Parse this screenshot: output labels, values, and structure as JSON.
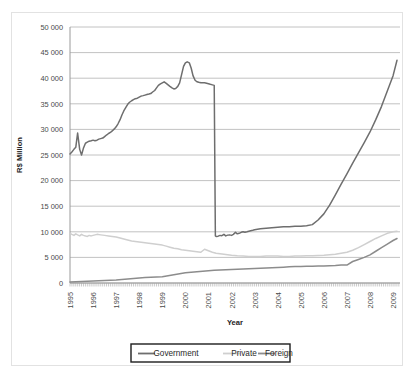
{
  "chart_data": {
    "type": "line",
    "title": "",
    "xlabel": "Year",
    "ylabel": "R$ Million",
    "xlim": [
      1995.0,
      2009.3
    ],
    "ylim": [
      0,
      50000
    ],
    "grid": true,
    "legend_position": "bottom",
    "ytick_labels": [
      "0",
      "5 000",
      "10 000",
      "15 000",
      "20 000",
      "25 000",
      "30 000",
      "35 000",
      "40 000",
      "45 000",
      "50 000"
    ],
    "ytick_values": [
      0,
      5000,
      10000,
      15000,
      20000,
      25000,
      30000,
      35000,
      40000,
      45000,
      50000
    ],
    "xtick_labels": [
      "1995",
      "1996",
      "1997",
      "1998",
      "1999",
      "2000",
      "2001",
      "2002",
      "2003",
      "2004",
      "2005",
      "2006",
      "2007",
      "2008",
      "2009"
    ],
    "xtick_values": [
      1995,
      1996,
      1997,
      1998,
      1999,
      2000,
      2001,
      2002,
      2003,
      2004,
      2005,
      2006,
      2007,
      2008,
      2009
    ],
    "series": [
      {
        "name": "Government",
        "color": "#6e6e6e",
        "x": [
          1995.0,
          1995.08,
          1995.17,
          1995.25,
          1995.33,
          1995.42,
          1995.5,
          1995.58,
          1995.67,
          1995.75,
          1995.83,
          1995.92,
          1996.0,
          1996.08,
          1996.17,
          1996.25,
          1996.33,
          1996.42,
          1996.5,
          1996.58,
          1996.67,
          1996.75,
          1996.83,
          1996.92,
          1997.0,
          1997.08,
          1997.17,
          1997.25,
          1997.33,
          1997.42,
          1997.5,
          1997.58,
          1997.67,
          1997.75,
          1997.83,
          1997.92,
          1998.0,
          1998.08,
          1998.17,
          1998.25,
          1998.33,
          1998.42,
          1998.5,
          1998.58,
          1998.67,
          1998.75,
          1998.83,
          1998.92,
          1999.0,
          1999.08,
          1999.17,
          1999.25,
          1999.33,
          1999.42,
          1999.5,
          1999.58,
          1999.67,
          1999.75,
          1999.83,
          1999.92,
          2000.0,
          2000.08,
          2000.17,
          2000.25,
          2000.33,
          2000.42,
          2000.5,
          2000.58,
          2000.67,
          2000.75,
          2000.83,
          2000.92,
          2001.0,
          2001.08,
          2001.17,
          2001.25,
          2001.3,
          2001.33,
          2001.42,
          2001.5,
          2001.58,
          2001.67,
          2001.75,
          2001.83,
          2001.92,
          2002.0,
          2002.08,
          2002.17,
          2002.25,
          2002.33,
          2002.42,
          2002.5,
          2002.58,
          2002.67,
          2002.75,
          2002.83,
          2002.92,
          2003.0,
          2003.25,
          2003.5,
          2003.75,
          2004.0,
          2004.25,
          2004.5,
          2004.75,
          2005.0,
          2005.25,
          2005.5,
          2005.75,
          2006.0,
          2006.25,
          2006.5,
          2006.75,
          2007.0,
          2007.25,
          2007.5,
          2007.75,
          2008.0,
          2008.25,
          2008.5,
          2008.75,
          2009.0,
          2009.17
        ],
        "values": [
          25200,
          25600,
          26100,
          26500,
          29300,
          26100,
          25000,
          26300,
          27300,
          27500,
          27700,
          27800,
          27900,
          27800,
          27900,
          28100,
          28200,
          28300,
          28600,
          28900,
          29200,
          29400,
          29700,
          30100,
          30500,
          31100,
          31900,
          32800,
          33600,
          34300,
          34900,
          35300,
          35600,
          35800,
          36000,
          36100,
          36300,
          36500,
          36600,
          36700,
          36800,
          36900,
          37000,
          37300,
          37600,
          38100,
          38600,
          38900,
          39100,
          39300,
          39000,
          38700,
          38400,
          38100,
          37900,
          38000,
          38400,
          39100,
          40600,
          42300,
          43000,
          43200,
          43000,
          42000,
          40500,
          39600,
          39300,
          39200,
          39100,
          39100,
          39100,
          39000,
          38900,
          38800,
          38700,
          38600,
          9200,
          9100,
          9150,
          9300,
          9250,
          9500,
          9200,
          9350,
          9400,
          9300,
          9500,
          9900,
          9600,
          9700,
          9900,
          10000,
          9900,
          10000,
          10100,
          10200,
          10300,
          10400,
          10600,
          10700,
          10800,
          10900,
          11000,
          11000,
          11100,
          11100,
          11200,
          11400,
          12300,
          13500,
          15200,
          17200,
          19300,
          21300,
          23400,
          25400,
          27400,
          29500,
          31900,
          34500,
          37500,
          40500,
          43500
        ]
      },
      {
        "name": "Private",
        "color": "#cfcfcf",
        "x": [
          1995.0,
          1995.08,
          1995.17,
          1995.25,
          1995.33,
          1995.42,
          1995.5,
          1995.58,
          1995.67,
          1995.75,
          1995.83,
          1995.92,
          1996.0,
          1996.17,
          1996.33,
          1996.5,
          1996.67,
          1996.83,
          1997.0,
          1997.17,
          1997.33,
          1997.5,
          1997.67,
          1997.83,
          1998.0,
          1998.17,
          1998.33,
          1998.5,
          1998.67,
          1998.83,
          1999.0,
          1999.17,
          1999.33,
          1999.5,
          1999.67,
          1999.83,
          2000.0,
          2000.17,
          2000.33,
          2000.5,
          2000.67,
          2000.83,
          2001.0,
          2001.17,
          2001.33,
          2001.5,
          2001.67,
          2001.83,
          2002.0,
          2002.25,
          2002.5,
          2002.75,
          2003.0,
          2003.25,
          2003.5,
          2003.75,
          2004.0,
          2004.25,
          2004.5,
          2004.75,
          2005.0,
          2005.25,
          2005.5,
          2005.75,
          2006.0,
          2006.25,
          2006.5,
          2006.75,
          2007.0,
          2007.25,
          2007.5,
          2007.75,
          2008.0,
          2008.25,
          2008.5,
          2008.75,
          2009.0,
          2009.17
        ],
        "values": [
          9700,
          9500,
          9300,
          9600,
          9400,
          9200,
          9500,
          9300,
          9200,
          9100,
          9300,
          9200,
          9300,
          9500,
          9400,
          9300,
          9200,
          9100,
          9000,
          8800,
          8600,
          8400,
          8200,
          8100,
          8000,
          7900,
          7800,
          7700,
          7600,
          7500,
          7400,
          7200,
          7000,
          6800,
          6700,
          6500,
          6400,
          6300,
          6200,
          6100,
          6000,
          6600,
          6300,
          6000,
          5800,
          5700,
          5600,
          5500,
          5400,
          5300,
          5250,
          5200,
          5200,
          5200,
          5250,
          5250,
          5250,
          5200,
          5200,
          5250,
          5250,
          5300,
          5300,
          5350,
          5400,
          5500,
          5600,
          5800,
          6000,
          6400,
          6900,
          7500,
          8100,
          8700,
          9200,
          9700,
          10000,
          10100
        ]
      },
      {
        "name": "Foreign",
        "color": "#8c8c8c",
        "x": [
          1995.0,
          1995.25,
          1995.5,
          1995.75,
          1996.0,
          1996.25,
          1996.5,
          1996.75,
          1997.0,
          1997.25,
          1997.5,
          1997.75,
          1998.0,
          1998.25,
          1998.5,
          1998.75,
          1999.0,
          1999.25,
          1999.5,
          1999.75,
          2000.0,
          2000.25,
          2000.5,
          2000.75,
          2001.0,
          2001.25,
          2001.5,
          2001.75,
          2002.0,
          2002.25,
          2002.5,
          2002.75,
          2003.0,
          2003.25,
          2003.5,
          2003.75,
          2004.0,
          2004.25,
          2004.5,
          2004.75,
          2005.0,
          2005.25,
          2005.5,
          2005.75,
          2006.0,
          2006.25,
          2006.5,
          2006.75,
          2007.0,
          2007.25,
          2007.5,
          2007.75,
          2008.0,
          2008.25,
          2008.5,
          2008.75,
          2009.0,
          2009.17
        ],
        "values": [
          200,
          250,
          300,
          350,
          400,
          450,
          500,
          550,
          600,
          700,
          800,
          900,
          1000,
          1050,
          1100,
          1150,
          1200,
          1400,
          1600,
          1800,
          2000,
          2100,
          2200,
          2300,
          2400,
          2500,
          2550,
          2600,
          2650,
          2700,
          2750,
          2800,
          2850,
          2900,
          2950,
          3000,
          3050,
          3100,
          3150,
          3200,
          3200,
          3250,
          3250,
          3300,
          3300,
          3350,
          3400,
          3500,
          3500,
          4200,
          4600,
          5000,
          5500,
          6200,
          6900,
          7600,
          8300,
          8700
        ]
      }
    ]
  }
}
